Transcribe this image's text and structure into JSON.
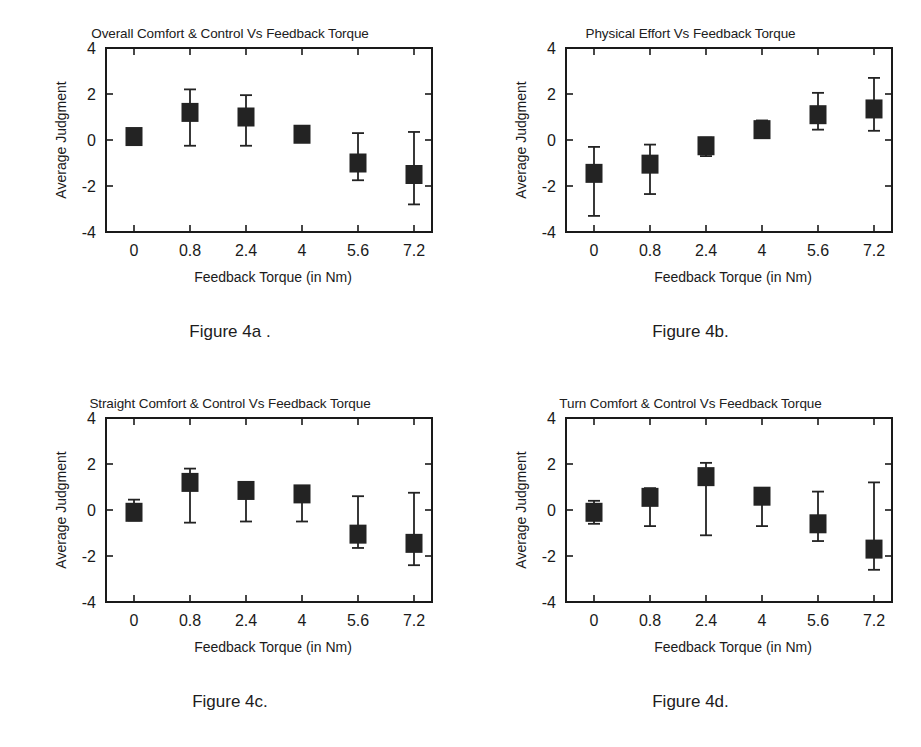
{
  "page": {
    "background": "#ffffff",
    "ink": "#1a1a1a",
    "marker_color": "#232323"
  },
  "axis": {
    "ylabel": "Average Judgment",
    "xlabel": "Feedback Torque (in Nm)",
    "yticks": [
      "4",
      "2",
      "0",
      "-2",
      "-4"
    ],
    "ytick_values": [
      4,
      2,
      0,
      -2,
      -4
    ],
    "ylim": [
      -4,
      4
    ],
    "xticks": [
      "0",
      "0.8",
      "2.4",
      "4",
      "5.6",
      "7.2"
    ]
  },
  "figures": [
    {
      "id": "fig-4a",
      "caption": "Figure 4a .",
      "title": "Overall Comfort & Control Vs Feedback Torque"
    },
    {
      "id": "fig-4b",
      "caption": "Figure 4b.",
      "title": "Physical Effort Vs Feedback Torque"
    },
    {
      "id": "fig-4c",
      "caption": "Figure 4c.",
      "title": "Straight Comfort & Control Vs Feedback Torque"
    },
    {
      "id": "fig-4d",
      "caption": "Figure 4d.",
      "title": "Turn Comfort & Control Vs Feedback Torque"
    }
  ],
  "chart_data": [
    {
      "type": "scatter",
      "id": "fig-4a",
      "title": "Overall Comfort & Control Vs Feedback Torque",
      "xlabel": "Feedback Torque (in Nm)",
      "ylabel": "Average Judgment",
      "categories": [
        "0",
        "0.8",
        "2.4",
        "4",
        "5.6",
        "7.2"
      ],
      "x": [
        0,
        0.8,
        2.4,
        4,
        5.6,
        7.2
      ],
      "values": [
        0.15,
        1.2,
        1.0,
        0.25,
        -1.0,
        -1.5
      ],
      "err_low": [
        0.15,
        1.45,
        1.25,
        0.3,
        0.75,
        1.3
      ],
      "err_high": [
        0.15,
        1.0,
        0.95,
        0.2,
        1.3,
        1.85
      ],
      "grid": false,
      "legend": "none",
      "ylim": [
        -4,
        4
      ]
    },
    {
      "type": "scatter",
      "id": "fig-4b",
      "title": "Physical Effort Vs Feedback Torque",
      "xlabel": "Feedback Torque (in Nm)",
      "ylabel": "Average Judgment",
      "categories": [
        "0",
        "0.8",
        "2.4",
        "4",
        "5.6",
        "7.2"
      ],
      "x": [
        0,
        0.8,
        2.4,
        4,
        5.6,
        7.2
      ],
      "values": [
        -1.45,
        -1.05,
        -0.25,
        0.45,
        1.1,
        1.35
      ],
      "err_low": [
        1.85,
        1.3,
        0.45,
        0.35,
        0.65,
        0.95
      ],
      "err_high": [
        1.15,
        0.85,
        0.35,
        0.4,
        0.95,
        1.35
      ],
      "grid": false,
      "legend": "none",
      "ylim": [
        -4,
        4
      ]
    },
    {
      "type": "scatter",
      "id": "fig-4c",
      "title": "Straight Comfort & Control Vs Feedback Torque",
      "xlabel": "Feedback Torque (in Nm)",
      "ylabel": "Average Judgment",
      "categories": [
        "0",
        "0.8",
        "2.4",
        "4",
        "5.6",
        "7.2"
      ],
      "x": [
        0,
        0.8,
        2.4,
        4,
        5.6,
        7.2
      ],
      "values": [
        -0.1,
        1.2,
        0.85,
        0.7,
        -1.05,
        -1.45
      ],
      "err_low": [
        0.35,
        1.75,
        1.35,
        1.2,
        0.6,
        0.95
      ],
      "err_high": [
        0.55,
        0.6,
        0.3,
        0.25,
        1.65,
        2.2
      ],
      "grid": false,
      "legend": "none",
      "ylim": [
        -4,
        4
      ]
    },
    {
      "type": "scatter",
      "id": "fig-4d",
      "title": "Turn Comfort & Control Vs Feedback Torque",
      "xlabel": "Feedback Torque (in Nm)",
      "ylabel": "Average Judgment",
      "categories": [
        "0",
        "0.8",
        "2.4",
        "4",
        "5.6",
        "7.2"
      ],
      "x": [
        0,
        0.8,
        2.4,
        4,
        5.6,
        7.2
      ],
      "values": [
        -0.1,
        0.55,
        1.45,
        0.6,
        -0.6,
        -1.7
      ],
      "err_low": [
        0.5,
        1.25,
        2.55,
        1.3,
        0.75,
        0.9
      ],
      "err_high": [
        0.5,
        0.4,
        0.6,
        0.35,
        1.4,
        2.9
      ],
      "grid": false,
      "legend": "none",
      "ylim": [
        -4,
        4
      ]
    }
  ]
}
